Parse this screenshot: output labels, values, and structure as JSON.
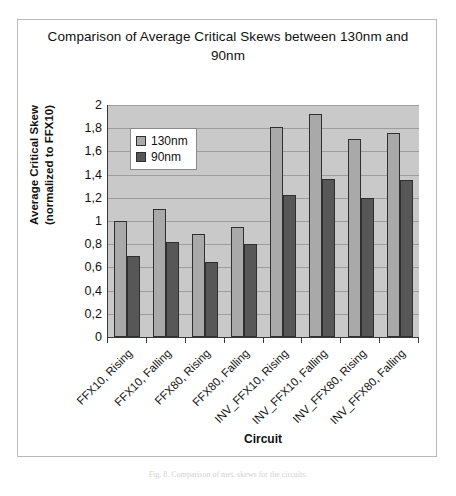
{
  "figure": {
    "caption": "Fig. 8. Comparison of met. skews for the circuits."
  },
  "chart_data": {
    "type": "bar",
    "title": "Comparison of Average Critical Skews between 130nm and 90nm",
    "xlabel": "Circuit",
    "ylabel": "Average Critical Skew (normalized to FFX10)",
    "ylabel_line1": "Average Critical Skew",
    "ylabel_line2": "(normalized to FFX10)",
    "ylim": [
      0,
      2
    ],
    "ytick_labels": [
      "2",
      "1,8",
      "1,6",
      "1,4",
      "1,2",
      "1",
      "0,8",
      "0,6",
      "0,4",
      "0,2",
      "0"
    ],
    "ytick_values": [
      2,
      1.8,
      1.6,
      1.4,
      1.2,
      1,
      0.8,
      0.6,
      0.4,
      0.2,
      0
    ],
    "grid": true,
    "legend_position": "upper-left-inside",
    "categories": [
      "FFX10, Rising",
      "FFX10, Falling",
      "FFX80, Rising",
      "FFX80, Falling",
      "INV_FFX10, Rising",
      "INV_FFX10, Falling",
      "INV_FFX80, Rising",
      "INV_FFX80, Falling"
    ],
    "series": [
      {
        "name": "130nm",
        "color": "#a9a9a9",
        "values": [
          1.0,
          1.1,
          0.89,
          0.95,
          1.81,
          1.92,
          1.71,
          1.76
        ]
      },
      {
        "name": "90nm",
        "color": "#575757",
        "values": [
          0.7,
          0.82,
          0.65,
          0.8,
          1.22,
          1.36,
          1.2,
          1.35
        ]
      }
    ]
  }
}
